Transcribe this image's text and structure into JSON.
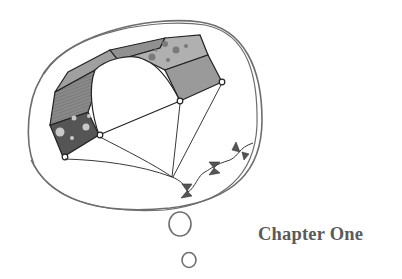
{
  "page": {
    "chapter_title": "Chapter One"
  },
  "illustration": {
    "subject": "thought bubble containing a kite",
    "colors": {
      "outline": "#6e6e6e",
      "ink": "#222222",
      "panel_light": "#a9a9a9",
      "panel_mid": "#8f8f8f",
      "panel_dark": "#555555",
      "dots": "#c8c8c8",
      "dots_dark": "#7a7a7a",
      "bows": "#555555"
    }
  }
}
